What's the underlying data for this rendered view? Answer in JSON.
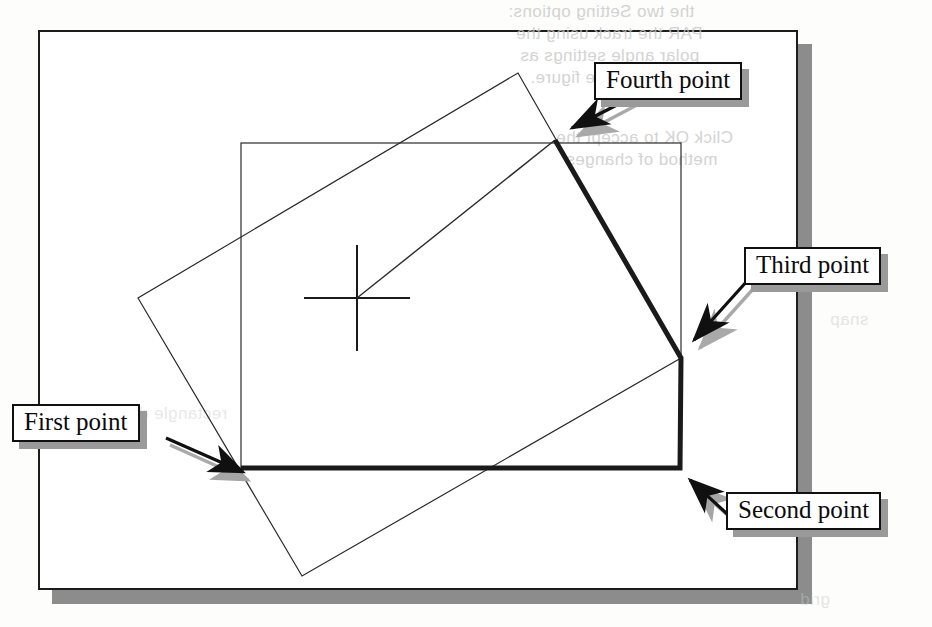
{
  "figure": {
    "type": "scanned-book-figure",
    "background_color": "#fdfdfc",
    "page_color": "#ffffff",
    "page_border_color": "#1c1c1c",
    "page_shadow_color": "#8c8c8c",
    "line_color": "#1a1a1a",
    "callout_shadow_color": "#9a9a9a"
  },
  "callouts": [
    {
      "id": "fourth",
      "label": "Fourth point",
      "arrow_style": "outlined-shadowed"
    },
    {
      "id": "third",
      "label": "Third point",
      "arrow_style": "outlined-shadowed"
    },
    {
      "id": "first",
      "label": "First point",
      "arrow_style": "solid-shadowed"
    },
    {
      "id": "second",
      "label": "Second point",
      "arrow_style": "solid-shadowed"
    }
  ],
  "geometry": {
    "crosshair": {
      "cx": 357,
      "cy": 298,
      "half_width": 53,
      "half_height": 53
    },
    "inner_rectangle": {
      "x": 241,
      "y": 143,
      "width": 440,
      "height": 325
    },
    "rotated_rectangle": {
      "points": [
        [
          518,
          73
        ],
        [
          681,
          358
        ],
        [
          302,
          576
        ],
        [
          138,
          298
        ]
      ]
    },
    "thick_polyline": {
      "points": [
        [
          241,
          468
        ],
        [
          680,
          468
        ],
        [
          681,
          358
        ],
        [
          555,
          140
        ]
      ],
      "stroke_width": 5
    },
    "thin_leader_line": {
      "from": [
        357,
        298
      ],
      "to": [
        555,
        140
      ]
    }
  },
  "bleed_through_text": [
    {
      "text": "the two Setting options:",
      "x": 508,
      "y": 2
    },
    {
      "text": "PAR the track using the",
      "x": 516,
      "y": 24
    },
    {
      "text": "polar angle settings as",
      "x": 520,
      "y": 46
    },
    {
      "text": "is shown in the figure.",
      "x": 530,
      "y": 68
    },
    {
      "text": "Click OK to accept the",
      "x": 556,
      "y": 128
    },
    {
      "text": "method of changes",
      "x": 566,
      "y": 150
    },
    {
      "text": "rectangle dim",
      "x": 120,
      "y": 404
    },
    {
      "text": "snap",
      "x": 830,
      "y": 310
    },
    {
      "text": "grid",
      "x": 800,
      "y": 590
    }
  ]
}
